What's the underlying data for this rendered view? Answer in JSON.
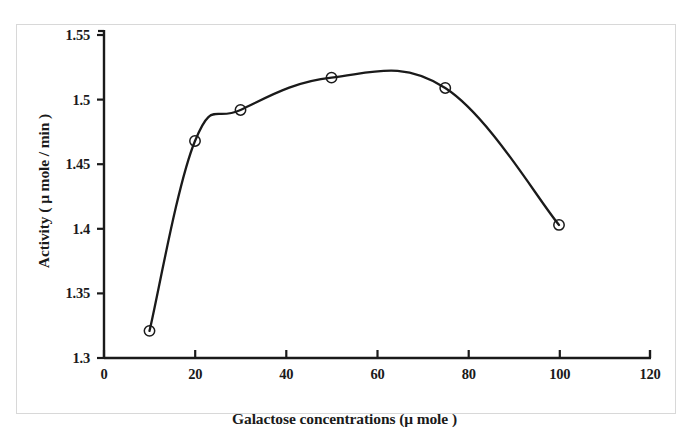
{
  "chart_data": {
    "type": "line",
    "title": "",
    "xlabel": "Galactose concentrations (μ mole )",
    "ylabel": "Activity ( μ mole / min )",
    "xlim": [
      0,
      120
    ],
    "ylim": [
      1.3,
      1.55
    ],
    "grid": false,
    "legend": null,
    "marker": "open-circle",
    "line_color": "#1a1a1a",
    "series": [
      {
        "name": "Activity vs galactose concentration",
        "x": [
          10,
          20,
          30,
          50,
          75,
          100
        ],
        "y": [
          1.321,
          1.468,
          1.492,
          1.517,
          1.509,
          1.403
        ]
      }
    ],
    "x_ticks": [
      "0",
      "20",
      "40",
      "60",
      "80",
      "100",
      "120"
    ],
    "x_tick_values": [
      0,
      20,
      40,
      60,
      80,
      100,
      120
    ],
    "y_ticks": [
      "1.3",
      "1.35",
      "1.4",
      "1.45",
      "1.5",
      "1.55"
    ],
    "y_tick_values": [
      1.3,
      1.35,
      1.4,
      1.45,
      1.5,
      1.55
    ],
    "annotations": []
  },
  "axes": {
    "x_title": "Galactose concentrations (μ mole )",
    "y_title": "Activity ( μ mole / min )"
  },
  "colors": {
    "ink": "#1a1a1a",
    "frame": "#d8d8d8",
    "background": "#ffffff"
  }
}
